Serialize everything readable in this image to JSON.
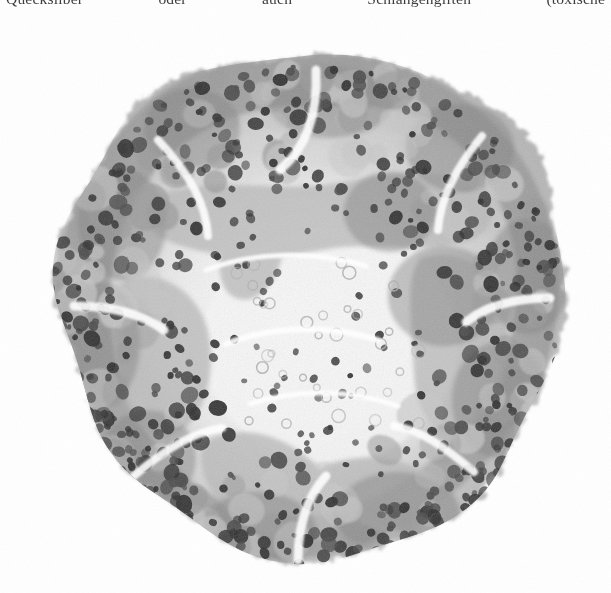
{
  "page": {
    "background_color": "#ffffff",
    "ink_color": "#2b2b2b",
    "text_line": "Quecksilber oder auch Schlangengiften (toxische",
    "text_line_clipped": true
  },
  "figure": {
    "name": "histological-micrograph",
    "type": "photomicrograph",
    "shape": "irregular-round",
    "stain_tone": "grayscale",
    "tones": {
      "background": "#ffffff",
      "pale_cytoplasm": "#efefef",
      "mid_tissue": "#c9c9c9",
      "dark_tissue": "#9a9a9a",
      "nucleus": "#4a4a4a",
      "nucleus_dark": "#2e2e2e"
    },
    "bounds_px": {
      "left": 30,
      "top": 44,
      "width": 548,
      "height": 534
    },
    "zones": [
      {
        "name": "cortical-rim",
        "tone": "dark",
        "note": "crowded cell clusters with large dark nuclei"
      },
      {
        "name": "intermediate-band",
        "tone": "mid",
        "note": "looser cords of cells"
      },
      {
        "name": "central-medulla",
        "tone": "pale",
        "note": "pale ground substance with small ring-shaped vacuoles and scattered nuclei"
      }
    ],
    "features": {
      "nuclei_count_approx": 560,
      "vacuole_rings_approx": 34,
      "cell_clusters_approx": 120
    }
  }
}
